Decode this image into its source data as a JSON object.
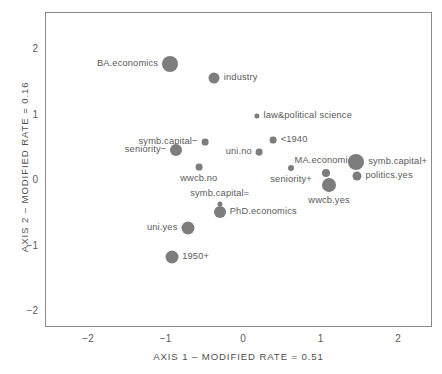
{
  "chart_data": {
    "type": "scatter",
    "title": "",
    "xlabel": "AXIS 1 – MODIFIED RATE = 0.51",
    "ylabel": "AXIS 2 – MODIFIED RATE = 0.16",
    "xlim": [
      -2.55,
      2.45
    ],
    "ylim": [
      -2.3,
      2.5
    ],
    "xticks": [
      -2,
      -1,
      0,
      1,
      2
    ],
    "xticklabels": [
      "−2",
      "−1",
      "0",
      "1",
      "2"
    ],
    "yticks": [
      -2,
      -1,
      0,
      1,
      2
    ],
    "yticklabels": [
      "−2",
      "−1",
      "0",
      "1",
      "2"
    ],
    "grid": false,
    "legend": "none",
    "marker_color": "#7d7d7d",
    "points": [
      {
        "label": "BA.economics",
        "x": -0.94,
        "y": 1.77,
        "size": 8.0,
        "label_pos": "left"
      },
      {
        "label": "industry",
        "x": -0.37,
        "y": 1.56,
        "size": 5.5,
        "label_pos": "right"
      },
      {
        "label": "law&political science",
        "x": 0.18,
        "y": 0.98,
        "size": 2.6,
        "label_pos": "right"
      },
      {
        "label": "symb.capital−",
        "x": -0.49,
        "y": 0.58,
        "size": 3.4,
        "label_pos": "left"
      },
      {
        "label": "<1940",
        "x": 0.39,
        "y": 0.61,
        "size": 3.4,
        "label_pos": "right"
      },
      {
        "label": "seniority−",
        "x": -0.86,
        "y": 0.46,
        "size": 6.0,
        "label_pos": "left"
      },
      {
        "label": "uni.no",
        "x": 0.21,
        "y": 0.43,
        "size": 3.4,
        "label_pos": "left"
      },
      {
        "label": "wwcb.no",
        "x": -0.57,
        "y": 0.2,
        "size": 3.4,
        "label_pos": "below"
      },
      {
        "label": "MA.economics",
        "x": 1.07,
        "y": 0.11,
        "size": 4.0,
        "label_pos": "above"
      },
      {
        "label": "symb.capital+",
        "x": 1.46,
        "y": 0.27,
        "size": 8.0,
        "label_pos": "right"
      },
      {
        "label": "politics.yes",
        "x": 1.47,
        "y": 0.06,
        "size": 4.5,
        "label_pos": "right"
      },
      {
        "label": "seniority+",
        "x": 0.62,
        "y": 0.18,
        "size": 3.0,
        "label_pos": "below"
      },
      {
        "label": "wwcb.yes",
        "x": 1.11,
        "y": -0.08,
        "size": 7.0,
        "label_pos": "below"
      },
      {
        "label": "symb.capital=",
        "x": -0.3,
        "y": -0.37,
        "size": 2.6,
        "label_pos": "above"
      },
      {
        "label": "PhD.economics",
        "x": -0.3,
        "y": -0.49,
        "size": 6.0,
        "label_pos": "right"
      },
      {
        "label": "uni.yes",
        "x": -0.71,
        "y": -0.73,
        "size": 6.5,
        "label_pos": "left"
      },
      {
        "label": "1950+",
        "x": -0.92,
        "y": -1.18,
        "size": 6.5,
        "label_pos": "right"
      }
    ]
  }
}
